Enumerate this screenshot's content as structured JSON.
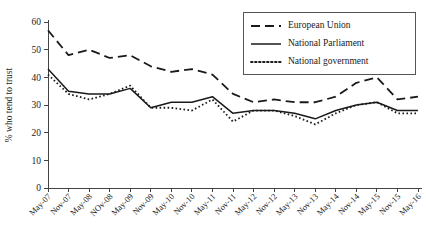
{
  "chart_data": {
    "type": "line",
    "title": "",
    "xlabel": "",
    "ylabel": "% who tend to trust",
    "ylim": [
      0,
      60
    ],
    "yticks": [
      0,
      10,
      20,
      30,
      40,
      50,
      60
    ],
    "grid": false,
    "legend_position": "top-right",
    "categories": [
      "May-07",
      "Nov-07",
      "May-08",
      "NOv-08",
      "May-09",
      "Nov-09",
      "May-10",
      "Nov-10",
      "May-11",
      "Nov-11",
      "May-12",
      "Nov-12",
      "May-13",
      "Nov-13",
      "May-14",
      "Nov-14",
      "May-15",
      "Nov-15",
      "May-16"
    ],
    "series": [
      {
        "name": "European Union",
        "style": "dashed",
        "values": [
          57,
          48,
          50,
          47,
          48,
          44,
          42,
          43,
          41,
          34,
          31,
          32,
          31,
          31,
          33,
          38,
          40,
          32,
          33
        ]
      },
      {
        "name": "National Parliament",
        "style": "solid",
        "values": [
          43,
          35,
          34,
          34,
          36,
          29,
          31,
          31,
          33,
          27,
          28,
          28,
          27,
          25,
          28,
          30,
          31,
          28,
          28
        ]
      },
      {
        "name": "National government",
        "style": "dotted",
        "values": [
          41,
          34,
          32,
          34,
          37,
          29,
          29,
          28,
          32,
          24,
          28,
          28,
          26,
          23,
          27,
          30,
          31,
          27,
          27
        ]
      }
    ]
  },
  "legend": {
    "entries": [
      {
        "label": "European Union"
      },
      {
        "label": "National Parliament"
      },
      {
        "label": "National government"
      }
    ]
  },
  "colors": {
    "ink": "#1a1a1a",
    "axis": "#444444",
    "background": "#ffffff"
  }
}
